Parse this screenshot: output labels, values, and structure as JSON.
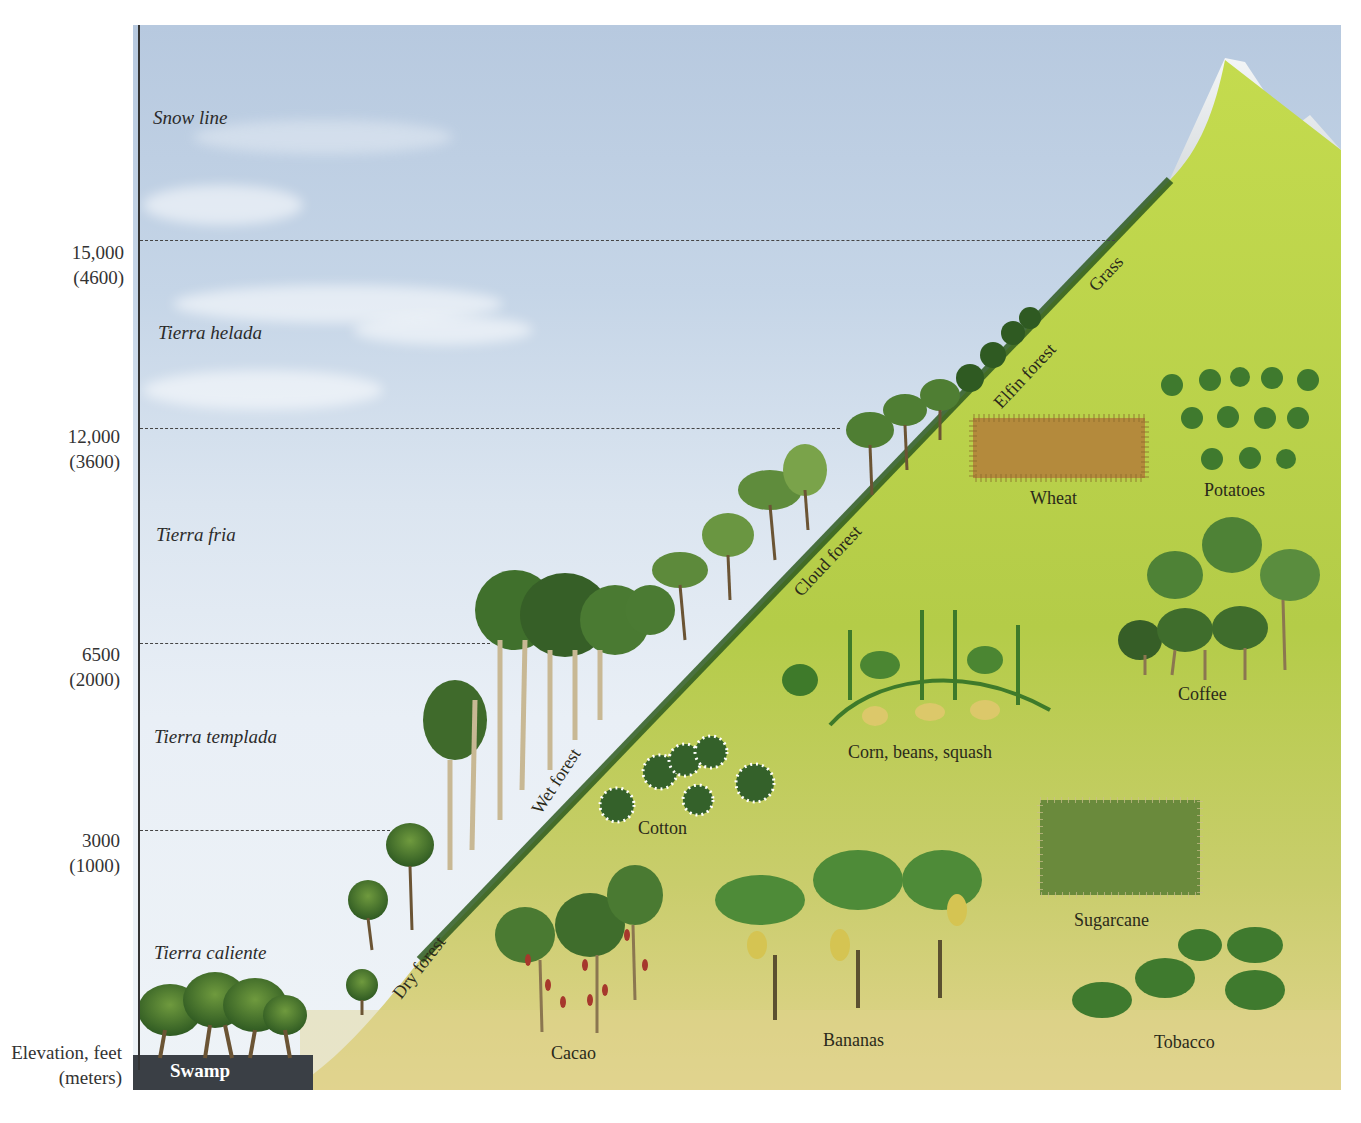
{
  "figure": {
    "axis_title_line1": "Elevation, feet",
    "axis_title_line2": "(meters)"
  },
  "elevations": [
    {
      "feet": "15,000",
      "meters": "(4600)"
    },
    {
      "feet": "12,000",
      "meters": "(3600)"
    },
    {
      "feet": "6500",
      "meters": "(2000)"
    },
    {
      "feet": "3000",
      "meters": "(1000)"
    }
  ],
  "zones": [
    {
      "name": "Snow line"
    },
    {
      "name": "Tierra helada"
    },
    {
      "name": "Tierra fria"
    },
    {
      "name": "Tierra templada"
    },
    {
      "name": "Tierra caliente"
    }
  ],
  "natural_vegetation": [
    {
      "name": "Grass"
    },
    {
      "name": "Elfin forest"
    },
    {
      "name": "Cloud forest"
    },
    {
      "name": "Wet forest"
    },
    {
      "name": "Dry forest"
    },
    {
      "name": "Swamp"
    }
  ],
  "crops": [
    {
      "name": "Wheat"
    },
    {
      "name": "Potatoes"
    },
    {
      "name": "Coffee"
    },
    {
      "name": "Corn, beans, squash"
    },
    {
      "name": "Cotton"
    },
    {
      "name": "Sugarcane"
    },
    {
      "name": "Cacao"
    },
    {
      "name": "Bananas"
    },
    {
      "name": "Tobacco"
    }
  ],
  "colors": {
    "sky_top": "#b7c9df",
    "sky_bottom": "#eef3f7",
    "slope_green": "#b6cf4a",
    "slope_lowland": "#d8d07a",
    "forest_dark": "#3d6b2a",
    "snow": "#eef1f3",
    "swamp_water": "#3a3f45"
  }
}
